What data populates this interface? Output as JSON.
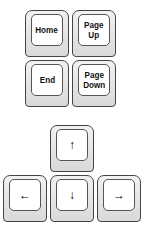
{
  "nav_keys": [
    {
      "id": "home",
      "label": "Home"
    },
    {
      "id": "page-up",
      "label": "Page\nUp"
    },
    {
      "id": "end",
      "label": "End"
    },
    {
      "id": "page-down",
      "label": "Page\nDown"
    }
  ],
  "arrow_keys": [
    {
      "id": "up",
      "glyph": "↑"
    },
    {
      "id": "left",
      "glyph": "←"
    },
    {
      "id": "down",
      "glyph": "↓"
    },
    {
      "id": "right",
      "glyph": "→"
    }
  ]
}
